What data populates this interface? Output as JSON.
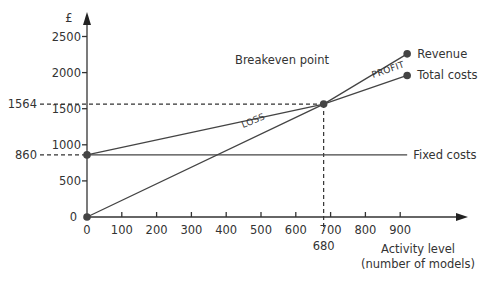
{
  "chart_data": {
    "type": "line",
    "ylabel": "£",
    "xlabel": "Activity level (number of models)",
    "xlabel_lines": [
      "Activity level",
      "(number of models)"
    ],
    "xlim": [
      0,
      960
    ],
    "ylim": [
      0,
      2650
    ],
    "x_ticks": [
      0,
      100,
      200,
      300,
      400,
      500,
      600,
      700,
      800,
      900
    ],
    "y_ticks": [
      0,
      500,
      1000,
      1500,
      2000,
      2500
    ],
    "grid": false,
    "series": [
      {
        "name": "Revenue",
        "points": [
          [
            0,
            0
          ],
          [
            680,
            1564
          ],
          [
            920,
            2260
          ]
        ]
      },
      {
        "name": "Total costs",
        "points": [
          [
            0,
            860
          ],
          [
            680,
            1564
          ],
          [
            920,
            1960
          ]
        ]
      },
      {
        "name": "Fixed costs",
        "points": [
          [
            0,
            860
          ],
          [
            920,
            860
          ]
        ]
      }
    ],
    "markers": [
      {
        "label": "fixed-costs-start",
        "x": 0,
        "y": 860
      },
      {
        "label": "origin",
        "x": 0,
        "y": 0
      },
      {
        "label": "breakeven",
        "x": 680,
        "y": 1564
      },
      {
        "label": "revenue-end",
        "x": 920,
        "y": 2260
      },
      {
        "label": "total-costs-end",
        "x": 920,
        "y": 1960
      }
    ],
    "guides": [
      {
        "type": "horizontal",
        "value": 1564,
        "label": "1564",
        "to_x": 680
      },
      {
        "type": "horizontal",
        "value": 860,
        "label": "860",
        "to_x": 0
      },
      {
        "type": "vertical",
        "value": 680,
        "label": "680",
        "to_y": 1564
      }
    ],
    "annotations": {
      "breakeven": "Breakeven point",
      "profit": "PROFIT",
      "loss": "LOSS"
    },
    "legend": "inline-right"
  }
}
